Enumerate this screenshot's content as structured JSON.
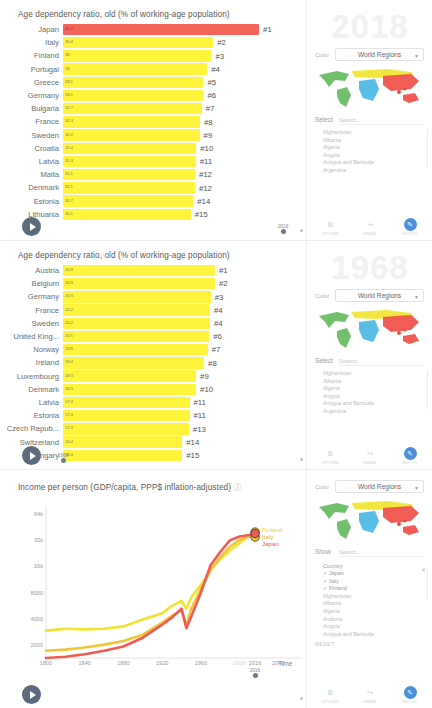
{
  "panels": [
    {
      "id": "panel-2018",
      "chart_title": "Age dependency ratio, old (% of working-age population)",
      "watermark_year": "2018",
      "color_label": "Color",
      "color_value": "World Regions",
      "select_label": "Select",
      "search_placeholder": "Search...",
      "year_marker": "2018",
      "chart_data": {
        "type": "bar",
        "title": "Age dependency ratio, old (% of working-age population)",
        "xlabel": "",
        "ylabel": "",
        "categories": [
          "Japan",
          "Italy",
          "Finland",
          "Portugal",
          "Greece",
          "Germany",
          "Bulgaria",
          "France",
          "Sweden",
          "Croatia",
          "Latvia",
          "Malta",
          "Denmark",
          "Estonia",
          "Lithuania"
        ],
        "values": [
          46.2,
          35.4,
          35.0,
          34.0,
          33.1,
          33.1,
          32.7,
          32.3,
          32.2,
          31.4,
          31.3,
          31.1,
          31.1,
          30.7,
          30.1
        ],
        "ranks": [
          "#1",
          "#2",
          "#3",
          "#4",
          "#5",
          "#6",
          "#7",
          "#8",
          "#9",
          "#10",
          "#11",
          "#12",
          "#12",
          "#14",
          "#15"
        ],
        "highlight": "Japan",
        "colors": {
          "highlight": "#f2635a",
          "bar": "#fff33b"
        }
      },
      "countries": [
        "Afghanistan",
        "Albania",
        "Algeria",
        "Angola",
        "Antigua and Barbuda",
        "Argentina"
      ],
      "bottom_icons": [
        {
          "name": "options-icon",
          "glyph": "⚙",
          "caption": "OPTIONS",
          "active": false
        },
        {
          "name": "share-icon",
          "glyph": "↪",
          "caption": "SHARE",
          "active": false
        },
        {
          "name": "edit-icon",
          "glyph": "✎",
          "caption": "EDITOR",
          "active": true
        }
      ]
    },
    {
      "id": "panel-1968",
      "chart_title": "Age dependency ratio, old (% of working-age population)",
      "watermark_year": "1968",
      "color_label": "Color",
      "color_value": "World Regions",
      "select_label": "Select",
      "search_placeholder": "Search...",
      "year_marker": "1968",
      "chart_data": {
        "type": "bar",
        "title": "Age dependency ratio, old (% of working-age population)",
        "xlabel": "",
        "ylabel": "",
        "categories": [
          "Austria",
          "Belgium",
          "Germany",
          "France",
          "Sweden",
          "United King...",
          "Norway",
          "Ireland",
          "Luxembourg",
          "Denmark",
          "Latvia",
          "Estonia",
          "Czech Repub...",
          "Switzerland",
          "Hungary"
        ],
        "values": [
          20.9,
          20.9,
          20.3,
          20.2,
          20.2,
          20.1,
          19.9,
          19.4,
          18.3,
          18.3,
          17.4,
          17.4,
          17.3,
          16.4,
          16.4
        ],
        "ranks": [
          "#1",
          "#2",
          "#3",
          "#4",
          "#4",
          "#6",
          "#7",
          "#8",
          "#9",
          "#10",
          "#11",
          "#11",
          "#13",
          "#14",
          "#15"
        ],
        "highlight": "",
        "colors": {
          "highlight": "#f2635a",
          "bar": "#fff33b"
        }
      },
      "countries": [
        "Afghanistan",
        "Albania",
        "Algeria",
        "Angola",
        "Antigua and Barbuda",
        "Argentina"
      ],
      "bottom_icons": [
        {
          "name": "options-icon",
          "glyph": "⚙",
          "caption": "OPTIONS",
          "active": false
        },
        {
          "name": "share-icon",
          "glyph": "↪",
          "caption": "SHARE",
          "active": false
        },
        {
          "name": "edit-icon",
          "glyph": "✎",
          "caption": "EDITOR",
          "active": true
        }
      ]
    }
  ],
  "line_panel": {
    "id": "panel-income",
    "chart_title": "Income per person (GDP/capita, PPP$ inflation-adjusted)",
    "info_glyph": "?",
    "color_label": "Color",
    "color_value": "World Regions",
    "show_label": "Show",
    "search_placeholder": "Search...",
    "list_header": "Country",
    "reset_label": "RESET",
    "year_marker": "2016",
    "selected_countries": [
      "Japan",
      "Italy",
      "Finland"
    ],
    "countries": [
      "Afghanistan",
      "Albania",
      "Algeria",
      "Andorra",
      "Angola",
      "Antigua and Barbuda"
    ],
    "bottom_icons": [
      {
        "name": "options-icon",
        "glyph": "⚙",
        "caption": "OPTIONS",
        "active": false
      },
      {
        "name": "share-icon",
        "glyph": "↪",
        "caption": "SHARE",
        "active": false
      },
      {
        "name": "edit-icon",
        "glyph": "✎",
        "caption": "EDITOR",
        "active": true
      }
    ],
    "chart_data": {
      "type": "line",
      "title": "Income per person (GDP/capita, PPP$ inflation-adjusted)",
      "xlabel": "Time",
      "ylabel": "",
      "yscale": "log",
      "yticks": [
        "2000",
        "4000",
        "8000",
        "16k",
        "32k",
        "64k"
      ],
      "ytick_values": [
        2000,
        4000,
        8000,
        16000,
        32000,
        64000
      ],
      "xticks": [
        "1800",
        "1840",
        "1880",
        "1920",
        "1960",
        "2000",
        "2016",
        "2040"
      ],
      "xtick_values": [
        1800,
        1840,
        1880,
        1920,
        1960,
        2000,
        2016,
        2040
      ],
      "xlim": [
        1800,
        2050
      ],
      "ylim": [
        1400,
        80000
      ],
      "grid": false,
      "legend_position": "right-endpoint",
      "series": [
        {
          "name": "Finland",
          "color": "#f2e32e",
          "x": [
            1800,
            1820,
            1840,
            1860,
            1880,
            1900,
            1920,
            1930,
            1940,
            1945,
            1950,
            1960,
            1970,
            1980,
            1990,
            2000,
            2010,
            2016
          ],
          "values": [
            2900,
            3050,
            3000,
            3050,
            3250,
            3900,
            4600,
            5600,
            6400,
            5200,
            7000,
            9800,
            14500,
            19500,
            24500,
            30000,
            36500,
            40000
          ]
        },
        {
          "name": "Italy",
          "color": "#f0c537",
          "x": [
            1800,
            1820,
            1840,
            1860,
            1880,
            1900,
            1920,
            1930,
            1940,
            1945,
            1950,
            1960,
            1970,
            1980,
            1990,
            2000,
            2010,
            2016
          ],
          "values": [
            1700,
            1750,
            1850,
            2000,
            2200,
            2600,
            3600,
            4300,
            5000,
            3300,
            5200,
            8800,
            14500,
            20500,
            27000,
            32500,
            35500,
            35000
          ]
        },
        {
          "name": "Japan",
          "color": "#ef5b52",
          "x": [
            1800,
            1820,
            1840,
            1860,
            1880,
            1900,
            1920,
            1930,
            1940,
            1945,
            1950,
            1960,
            1970,
            1980,
            1990,
            2000,
            2010,
            2016
          ],
          "values": [
            1400,
            1450,
            1550,
            1700,
            1900,
            2400,
            3400,
            4100,
            5200,
            3100,
            4200,
            8000,
            16500,
            23500,
            32000,
            35500,
            37000,
            38500
          ]
        }
      ],
      "endpoint_labels": [
        {
          "name": "Finland",
          "color": "#e8d52a"
        },
        {
          "name": "Italy",
          "color": "#e5b52e"
        },
        {
          "name": "Japan",
          "color": "#ef5b52"
        }
      ]
    }
  }
}
